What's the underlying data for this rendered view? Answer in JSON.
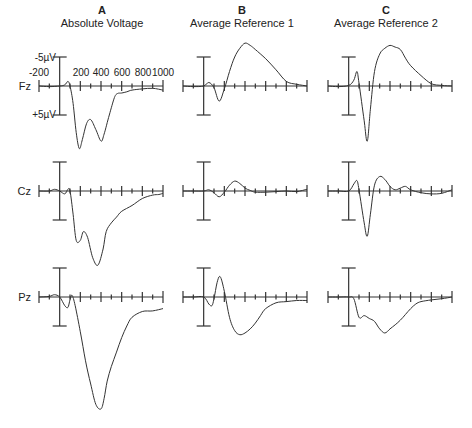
{
  "figure": {
    "columns": [
      {
        "letter": "A",
        "title": "Absolute Voltage"
      },
      {
        "letter": "B",
        "title": "Average Reference 1"
      },
      {
        "letter": "C",
        "title": "Average Reference 2"
      }
    ],
    "rows": [
      {
        "electrode": "Fz"
      },
      {
        "electrode": "Cz"
      },
      {
        "electrode": "Pz"
      }
    ],
    "x_tick_labels": [
      "-200",
      "200",
      "400",
      "600",
      "800",
      "1000"
    ],
    "y_scale_labels": {
      "top": "-5µV",
      "bottom": "+5µV"
    }
  },
  "chart_data": {
    "type": "line",
    "title": "",
    "xlabel": "Time (ms)",
    "ylabel": "Voltage (µV), negative up",
    "xlim": [
      -200,
      1000
    ],
    "ylim": [
      -5,
      5
    ],
    "y_inverted": true,
    "grid": false,
    "x_ticks_major": [
      -200,
      0,
      200,
      400,
      600,
      800,
      1000
    ],
    "x_ticks_minor": [
      -100,
      100,
      300,
      500,
      700,
      900
    ],
    "x_tick_labels": [
      "-200",
      "200",
      "400",
      "600",
      "800",
      "1000"
    ],
    "scale_bar": {
      "top_label": "-5µV",
      "bottom_label": "+5µV"
    },
    "panels": [
      {
        "column": "A",
        "column_title": "Absolute Voltage",
        "row": "Fz",
        "x": [
          -200,
          -100,
          0,
          50,
          80,
          100,
          130,
          160,
          190,
          220,
          260,
          300,
          350,
          400,
          430,
          480,
          530,
          560,
          600,
          650,
          700,
          800,
          900,
          1000
        ],
        "y": [
          0,
          0.1,
          0,
          -0.2,
          -0.8,
          0,
          3,
          8,
          10.8,
          9.2,
          6.5,
          5.8,
          7.5,
          9.5,
          8.3,
          5,
          2,
          1.3,
          1.2,
          1,
          0.7,
          0.5,
          0.4,
          0.7
        ]
      },
      {
        "column": "B",
        "column_title": "Average Reference 1",
        "row": "Fz",
        "x": [
          -200,
          -100,
          0,
          50,
          100,
          150,
          200,
          250,
          300,
          350,
          400,
          450,
          500,
          600,
          700,
          800,
          900,
          1000
        ],
        "y": [
          0,
          0.1,
          0,
          -0.6,
          0.3,
          2.6,
          0.5,
          -2.5,
          -5,
          -6.5,
          -7.4,
          -7,
          -6.3,
          -4.7,
          -2.8,
          -0.8,
          -0.3,
          0
        ]
      },
      {
        "column": "C",
        "column_title": "Average Reference 2",
        "row": "Fz",
        "x": [
          -200,
          -100,
          0,
          50,
          80,
          100,
          150,
          180,
          210,
          250,
          300,
          350,
          400,
          450,
          500,
          550,
          600,
          700,
          800,
          900,
          1000
        ],
        "y": [
          0,
          0.1,
          -0.1,
          -1,
          -2.5,
          -0.5,
          6,
          9.5,
          4,
          -2.5,
          -5.5,
          -6.5,
          -7,
          -6.7,
          -6.3,
          -4.8,
          -3.5,
          -1.8,
          -0.4,
          -0.1,
          0
        ]
      },
      {
        "column": "A",
        "column_title": "Absolute Voltage",
        "row": "Cz",
        "x": [
          -200,
          -100,
          -50,
          0,
          50,
          80,
          100,
          130,
          160,
          200,
          230,
          270,
          320,
          370,
          420,
          450,
          500,
          550,
          600,
          700,
          800,
          900,
          960,
          1000
        ],
        "y": [
          0,
          0,
          -0.3,
          0,
          0.5,
          -0.3,
          0,
          4,
          8.5,
          8.5,
          7,
          8,
          11.5,
          12.8,
          10,
          7,
          5.5,
          4.5,
          3.5,
          2.5,
          1.3,
          0.7,
          0.6,
          0.4
        ]
      },
      {
        "column": "B",
        "column_title": "Average Reference 1",
        "row": "Cz",
        "x": [
          -200,
          -100,
          0,
          50,
          100,
          150,
          200,
          250,
          300,
          350,
          400,
          450,
          500,
          600,
          700,
          800,
          900,
          1000
        ],
        "y": [
          0,
          0,
          0,
          -0.2,
          0.3,
          1,
          0.2,
          -1,
          -1.7,
          -1.3,
          -0.5,
          -0.1,
          0.2,
          0.2,
          0.1,
          0,
          0.1,
          -0.3
        ]
      },
      {
        "column": "C",
        "column_title": "Average Reference 2",
        "row": "Cz",
        "x": [
          -200,
          -100,
          0,
          50,
          80,
          100,
          150,
          180,
          210,
          250,
          300,
          350,
          400,
          450,
          500,
          550,
          600,
          700,
          800,
          900,
          1000
        ],
        "y": [
          0,
          0,
          0,
          -1.2,
          -1.8,
          -0.2,
          5.5,
          7.8,
          4,
          -1,
          -2.5,
          -2,
          -0.8,
          -0.2,
          -0.5,
          -0.8,
          -0.2,
          0.3,
          0.5,
          0.4,
          -0.2
        ]
      },
      {
        "column": "A",
        "column_title": "Absolute Voltage",
        "row": "Pz",
        "x": [
          -200,
          -100,
          -50,
          0,
          50,
          80,
          100,
          120,
          150,
          200,
          250,
          300,
          350,
          400,
          430,
          460,
          500,
          550,
          600,
          650,
          700,
          800,
          900,
          1000
        ],
        "y": [
          0,
          -0.1,
          -0.4,
          0,
          1.5,
          1.8,
          0.5,
          -0.3,
          1.5,
          6,
          11,
          15,
          18.5,
          19.3,
          17.5,
          14.5,
          12,
          9.5,
          7,
          5,
          3.5,
          2.5,
          2.4,
          2
        ]
      },
      {
        "column": "B",
        "column_title": "Average Reference 1",
        "row": "Pz",
        "x": [
          -200,
          -100,
          0,
          50,
          80,
          100,
          130,
          160,
          200,
          250,
          300,
          350,
          400,
          450,
          500,
          550,
          600,
          700,
          800,
          900,
          1000
        ],
        "y": [
          0,
          0,
          0,
          1.2,
          1.5,
          0.3,
          -2.5,
          -3.5,
          -1,
          3.5,
          5.8,
          6.5,
          6.2,
          5.5,
          4.5,
          3.2,
          2,
          1,
          0.8,
          0.6,
          0.6
        ]
      },
      {
        "column": "C",
        "column_title": "Average Reference 2",
        "row": "Pz",
        "x": [
          -200,
          -100,
          0,
          50,
          100,
          150,
          200,
          250,
          300,
          350,
          400,
          450,
          500,
          550,
          600,
          650,
          700,
          800,
          900,
          1000
        ],
        "y": [
          0,
          0,
          0,
          0.3,
          3.5,
          3.2,
          3.7,
          4.2,
          5.5,
          6.2,
          5.5,
          4.8,
          4,
          3,
          2,
          1.2,
          0.8,
          0.5,
          0.3,
          0
        ]
      }
    ]
  }
}
